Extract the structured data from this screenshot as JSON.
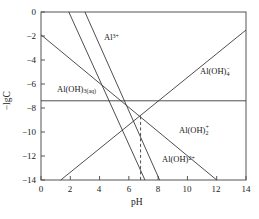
{
  "chart_data": {
    "type": "line",
    "title": "",
    "xlabel": "pH",
    "ylabel": "−lgC",
    "xlim": [
      0,
      14
    ],
    "ylim": [
      -14,
      0
    ],
    "y_inverted": true,
    "grid": false,
    "legend_position": "inline-annotations",
    "xticks": [
      0,
      2,
      4,
      6,
      8,
      10,
      12,
      14
    ],
    "xtick_labels": [
      "0",
      "2",
      "4",
      "6",
      "8",
      "10",
      "12",
      "14"
    ],
    "yticks": [
      0,
      -2,
      -4,
      -6,
      -8,
      -10,
      -12,
      -14
    ],
    "ytick_labels": [
      "0",
      "−2",
      "−4",
      "−6",
      "−8",
      "−10",
      "−12",
      "−14"
    ],
    "series": [
      {
        "name": "Al3+",
        "label": "Al",
        "charge": "3+",
        "style": "solid",
        "points": [
          [
            1.9,
            0
          ],
          [
            7.1,
            -14
          ]
        ]
      },
      {
        "name": "Al(OH)2+",
        "label": "Al(OH)",
        "charge": "2+",
        "style": "solid",
        "points": [
          [
            3.0,
            0
          ],
          [
            8.1,
            -14
          ]
        ]
      },
      {
        "name": "Al(OH)2+ (dihydroxo)",
        "label": "Al(OH)",
        "subscript": "2",
        "charge": "+",
        "style": "solid",
        "points": [
          [
            0,
            -1.9
          ],
          [
            12.0,
            -14
          ]
        ]
      },
      {
        "name": "Al(OH)4-",
        "label": "Al(OH)",
        "subscript": "4",
        "charge": "−",
        "style": "solid",
        "points": [
          [
            1.35,
            -14
          ],
          [
            14.0,
            -1.5
          ]
        ]
      },
      {
        "name": "Al(OH)3(aq)",
        "label": "Al(OH)",
        "subscript": "3(aq)",
        "charge": "",
        "style": "solid-horizontal",
        "points": [
          [
            0,
            -7.4
          ],
          [
            14.0,
            -7.4
          ]
        ]
      }
    ],
    "annotations": [
      {
        "name": "dashed-marker",
        "style": "dashed",
        "x": 6.8,
        "y_from": -8.7,
        "y_to": -14.0
      }
    ]
  },
  "labels": {
    "al3": {
      "text": "Al",
      "sup": "3+"
    },
    "al_oh_4": {
      "text": "Al(OH)",
      "sub": "4",
      "sup": "−"
    },
    "al_oh_3aq": {
      "text": "Al(OH)",
      "sub": "3(aq)"
    },
    "al_oh_2": {
      "text": "Al(OH)",
      "sub": "2",
      "sup": "+"
    },
    "al_oh_1": {
      "text": "Al(OH)",
      "sup": "2+"
    }
  },
  "axes": {
    "x_title": "pH",
    "y_title": "−lgC"
  },
  "colors": {
    "line": "#3a3a3a",
    "frame": "#555555",
    "text": "#1a1a1a",
    "background": "#ffffff"
  }
}
